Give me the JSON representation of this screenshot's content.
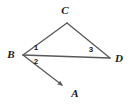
{
  "figure": {
    "kind": "geometry-diagram",
    "width": 131,
    "height": 105,
    "background_color": "#ffffff",
    "stroke_color": "#595959",
    "label_color": "#1a1a1a",
    "stroke_width": 1.3
  },
  "points": {
    "A": {
      "label": "A",
      "x": 65,
      "y": 88,
      "label_x": 75,
      "label_y": 93
    },
    "B": {
      "label": "B",
      "x": 23,
      "y": 55,
      "label_x": 11,
      "label_y": 54
    },
    "C": {
      "label": "C",
      "x": 67,
      "y": 23,
      "label_x": 65,
      "label_y": 10
    },
    "D": {
      "label": "D",
      "x": 110,
      "y": 58,
      "label_x": 119,
      "label_y": 58
    }
  },
  "segments": [
    {
      "name": "segment-BC",
      "from": "B",
      "to": "C",
      "x1": 23,
      "y1": 55,
      "x2": 67,
      "y2": 23,
      "arrow": false
    },
    {
      "name": "segment-CD",
      "from": "C",
      "to": "D",
      "x1": 67,
      "y1": 23,
      "x2": 110,
      "y2": 58,
      "arrow": false
    },
    {
      "name": "segment-BD",
      "from": "B",
      "to": "D",
      "x1": 23,
      "y1": 55,
      "x2": 110,
      "y2": 58,
      "arrow": false
    },
    {
      "name": "ray-BA",
      "from": "B",
      "to": "A",
      "x1": 23,
      "y1": 55,
      "x2": 65,
      "y2": 88,
      "arrow": true
    }
  ],
  "angles": [
    {
      "name": "angle-1",
      "label": "1",
      "x": 36,
      "y": 48,
      "at_vertex": "B",
      "between": "BC and BD"
    },
    {
      "name": "angle-2",
      "label": "2",
      "x": 36,
      "y": 62,
      "at_vertex": "B",
      "between": "BD and BA"
    },
    {
      "name": "angle-3",
      "label": "3",
      "x": 91,
      "y": 50,
      "at_vertex": "D",
      "between": "DC and DB"
    }
  ]
}
